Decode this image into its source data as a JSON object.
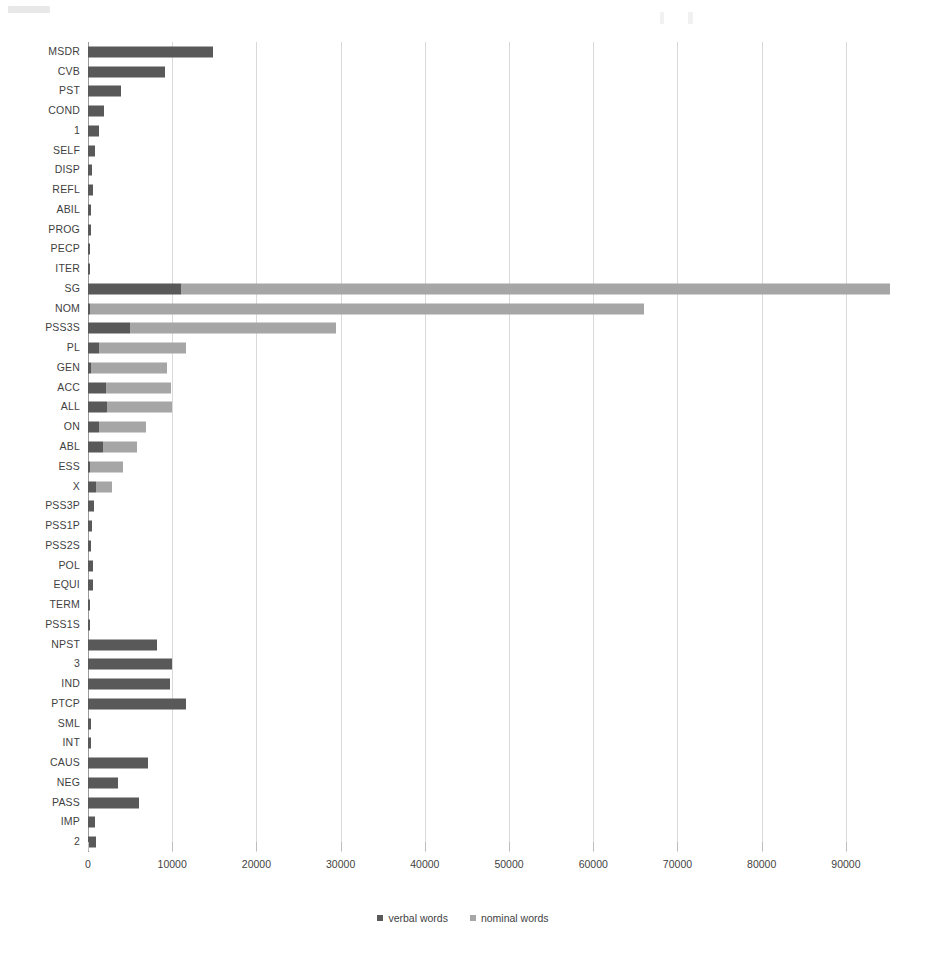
{
  "chart_data": {
    "type": "bar",
    "orientation": "horizontal",
    "stacked": true,
    "title": "",
    "subtitle": "",
    "xlabel": "",
    "ylabel": "",
    "xlim": [
      0,
      95000
    ],
    "xticks": [
      0,
      10000,
      20000,
      30000,
      40000,
      50000,
      60000,
      70000,
      80000,
      90000
    ],
    "xticklabels": [
      "0",
      "10000",
      "20000",
      "30000",
      "40000",
      "50000",
      "60000",
      "70000",
      "80000",
      "90000"
    ],
    "grid": "vertical",
    "legend_position": "bottom",
    "categories": [
      "MSDR",
      "CVB",
      "PST",
      "COND",
      "1",
      "SELF",
      "DISP",
      "REFL",
      "ABIL",
      "PROG",
      "PECP",
      "ITER",
      "SG",
      "NOM",
      "PSS3S",
      "PL",
      "GEN",
      "ACC",
      "ALL",
      "ON",
      "ABL",
      "ESS",
      "X",
      "PSS3P",
      "PSS1P",
      "PSS2S",
      "POL",
      "EQUI",
      "TERM",
      "PSS1S",
      "NPST",
      "3",
      "IND",
      "PTCP",
      "SML",
      "INT",
      "CAUS",
      "NEG",
      "PASS",
      "IMP",
      "2"
    ],
    "series": [
      {
        "name": "verbal words",
        "color": "#595959",
        "values": [
          14800,
          9200,
          3900,
          1900,
          1300,
          800,
          500,
          600,
          400,
          400,
          250,
          150,
          11000,
          250,
          5000,
          1300,
          400,
          2100,
          2300,
          1300,
          1800,
          150,
          1000,
          700,
          500,
          350,
          650,
          600,
          200,
          150,
          8200,
          10000,
          9700,
          11600,
          350,
          300,
          7100,
          3600,
          6000,
          800,
          1000
        ]
      },
      {
        "name": "nominal words",
        "color": "#a6a6a6",
        "values": [
          0,
          0,
          0,
          0,
          0,
          0,
          0,
          0,
          0,
          0,
          0,
          0,
          84200,
          65800,
          24400,
          10300,
          9000,
          7800,
          7700,
          5600,
          4000,
          3900,
          1900,
          0,
          0,
          0,
          0,
          0,
          0,
          0,
          0,
          0,
          0,
          0,
          0,
          0,
          0,
          0,
          0,
          0,
          0
        ]
      }
    ],
    "totals": [
      14800,
      9200,
      3900,
      1900,
      1300,
      800,
      500,
      600,
      400,
      400,
      250,
      150,
      95200,
      66050,
      29400,
      11600,
      9400,
      9900,
      10000,
      6900,
      5800,
      4050,
      2900,
      700,
      500,
      350,
      650,
      600,
      200,
      150,
      8200,
      10000,
      9700,
      11600,
      350,
      300,
      7100,
      3600,
      6000,
      800,
      1000
    ]
  },
  "legend": {
    "items": [
      {
        "label": "verbal words",
        "swatch": "verbal-swatch-icon"
      },
      {
        "label": "nominal words",
        "swatch": "nominal-swatch-icon"
      }
    ]
  },
  "colors": {
    "verbal": "#595959",
    "nominal": "#a6a6a6",
    "gridline": "#d9d9d9",
    "axis": "#9a9a9a",
    "text": "#3f3f3f",
    "background": "#ffffff"
  }
}
